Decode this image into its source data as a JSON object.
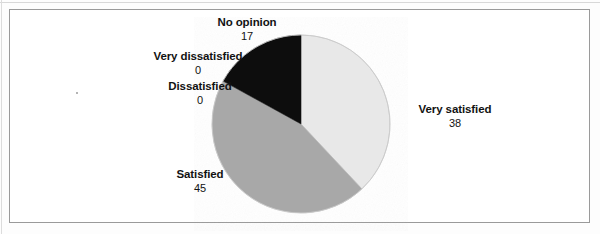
{
  "figure": {
    "background_color": "#ffffff",
    "frame_color": "#9a9a9a"
  },
  "chart_data": {
    "type": "pie",
    "title": "",
    "subtitle": "",
    "xlabel": "",
    "ylabel": "",
    "legend_position": "none",
    "grid": false,
    "start_angle_deg": 0,
    "direction": "clockwise",
    "total": 100,
    "categories": [
      "Very satisfied",
      "Satisfied",
      "Dissatisfied",
      "Very dissatisfied",
      "No opinion"
    ],
    "values": [
      38,
      45,
      0,
      0,
      17
    ],
    "slices": [
      {
        "label": "Very satisfied",
        "value": 38,
        "value_text": "38",
        "color": "#e8e8e8",
        "start_deg": 0,
        "end_deg": 136.8,
        "label_position": "right"
      },
      {
        "label": "Satisfied",
        "value": 45,
        "value_text": "45",
        "color": "#a8a8a8",
        "start_deg": 136.8,
        "end_deg": 298.8,
        "label_position": "lower-left"
      },
      {
        "label": "Dissatisfied",
        "value": 0,
        "value_text": "0",
        "color": "#a8a8a8",
        "start_deg": 298.8,
        "end_deg": 298.8,
        "label_position": "left"
      },
      {
        "label": "Very dissatisfied",
        "value": 0,
        "value_text": "0",
        "color": "#a8a8a8",
        "start_deg": 298.8,
        "end_deg": 298.8,
        "label_position": "upper-left"
      },
      {
        "label": "No opinion",
        "value": 17,
        "value_text": "17",
        "color": "#0d0d0d",
        "start_deg": 298.8,
        "end_deg": 360,
        "label_position": "top"
      }
    ],
    "geometry": {
      "center_x": 301,
      "center_y": 124,
      "radius": 89
    }
  }
}
